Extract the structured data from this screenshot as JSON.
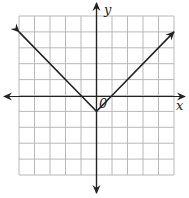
{
  "chart_data": {
    "type": "line",
    "title": "",
    "function": "y = |x| - 1",
    "xlabel": "x",
    "ylabel": "y",
    "origin_label": "0",
    "xlim": [
      -5,
      5
    ],
    "ylim": [
      -5,
      5
    ],
    "grid": true,
    "series": [
      {
        "name": "absolute value graph",
        "x": [
          -5,
          -1,
          0,
          1,
          5
        ],
        "y": [
          4,
          0,
          -1,
          0,
          4
        ]
      }
    ],
    "vertex": [
      0,
      -1
    ],
    "arrows": [
      "both ends of graph",
      "both ends of x-axis",
      "both ends of y-axis"
    ]
  },
  "colors": {
    "grid": "#b8b8b8",
    "axis": "#222222",
    "line": "#222222",
    "background": "#ffffff"
  }
}
